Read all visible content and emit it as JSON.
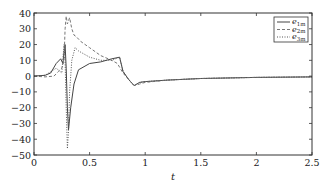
{
  "chart_data": {
    "type": "line",
    "title": "",
    "xlabel": "t",
    "ylabel": "",
    "xlim": [
      0,
      2.5
    ],
    "ylim": [
      -50,
      40
    ],
    "xticks": [
      0,
      0.5,
      1,
      1.5,
      2,
      2.5
    ],
    "xtick_labels": [
      "0",
      "0.5",
      "1",
      "1.5",
      "2",
      "2.5"
    ],
    "yticks": [
      40,
      30,
      20,
      10,
      0,
      -10,
      -20,
      -30,
      -40,
      -50
    ],
    "ytick_labels": [
      "40",
      "30",
      "20",
      "10",
      "0",
      "−10",
      "−20",
      "−30",
      "−40",
      "−50"
    ],
    "grid": false,
    "legend_position": "upper right",
    "series": [
      {
        "name": "e1m",
        "label_main": "e",
        "label_sub": "1m",
        "style": "solid",
        "color": "#444444",
        "x": [
          0,
          0.1,
          0.15,
          0.2,
          0.24,
          0.26,
          0.27,
          0.28,
          0.29,
          0.3,
          0.31,
          0.33,
          0.36,
          0.4,
          0.5,
          0.6,
          0.7,
          0.77,
          0.8,
          0.85,
          0.9,
          0.95,
          1.0,
          1.2,
          1.5,
          2.0,
          2.5
        ],
        "y": [
          0,
          0.5,
          2,
          8,
          11,
          8,
          15,
          20,
          5,
          -20,
          -34,
          -20,
          -5,
          4,
          8,
          9,
          11,
          12,
          3,
          -2,
          -6,
          -4,
          -3.5,
          -2.5,
          -1.5,
          -0.8,
          -0.5
        ]
      },
      {
        "name": "e2m",
        "label_main": "e",
        "label_sub": "2m",
        "style": "dashed",
        "color": "#777777",
        "x": [
          0,
          0.1,
          0.18,
          0.22,
          0.25,
          0.27,
          0.28,
          0.29,
          0.3,
          0.32,
          0.34,
          0.36,
          0.38,
          0.42,
          0.5,
          0.6,
          0.7,
          0.75,
          0.8,
          0.85,
          0.9,
          0.95,
          1.0,
          1.2,
          1.5,
          2.0,
          2.5
        ],
        "y": [
          0,
          -0.5,
          0,
          3,
          5,
          10,
          30,
          38,
          33,
          37,
          30,
          26,
          25,
          22,
          18,
          13,
          10,
          8,
          2,
          -2,
          -6,
          -5,
          -4,
          -2.5,
          -1.5,
          -0.8,
          -0.5
        ]
      },
      {
        "name": "e3m",
        "label_main": "e",
        "label_sub": "3m",
        "style": "dotted",
        "color": "#555555",
        "x": [
          0,
          0.1,
          0.2,
          0.25,
          0.27,
          0.28,
          0.29,
          0.3,
          0.31,
          0.32,
          0.34,
          0.37,
          0.4,
          0.5,
          0.6,
          0.7,
          0.77,
          0.8,
          0.85,
          0.9,
          0.95,
          1.0,
          1.2,
          1.5,
          2.0,
          2.5
        ],
        "y": [
          0,
          0.5,
          5,
          2,
          20,
          10,
          -20,
          -46,
          -35,
          -10,
          10,
          18,
          16,
          12,
          10,
          10,
          12,
          3,
          -2,
          -6,
          -4,
          -3.5,
          -2.5,
          -1.5,
          -0.8,
          -0.5
        ]
      }
    ]
  },
  "plot": {
    "x_axis_label": "t",
    "legend": {
      "items": [
        {
          "main": "e",
          "sub": "1m"
        },
        {
          "main": "e",
          "sub": "2m"
        },
        {
          "main": "e",
          "sub": "3m"
        }
      ]
    }
  }
}
